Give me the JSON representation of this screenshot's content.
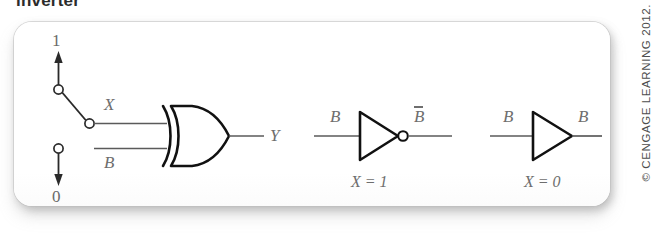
{
  "caption": {
    "text": "inverter"
  },
  "copyright": {
    "text": "© CENGAGE LEARNING 2012."
  },
  "circuits": {
    "main": {
      "name": "controlled-inverter-xor",
      "switch": {
        "high_label": "1",
        "low_label": "0"
      },
      "labels": {
        "control": "X",
        "data_input": "B",
        "output": "Y"
      }
    },
    "equivalent_inverting": {
      "name": "inverter-equivalent",
      "input_label": "B",
      "output_label": "B",
      "output_overbar": true,
      "condition": "X = 1"
    },
    "equivalent_buffer": {
      "name": "buffer-equivalent",
      "input_label": "B",
      "output_label": "B",
      "output_overbar": false,
      "condition": "X = 0"
    }
  },
  "colors": {
    "line": "#5a5a5a",
    "gate_stroke": "#111111",
    "label": "#6e6e6e",
    "panel_bg": "#ffffff",
    "page_bg": "#ffffff"
  }
}
